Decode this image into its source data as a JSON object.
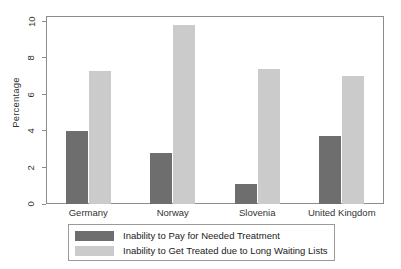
{
  "chart_data": {
    "type": "bar",
    "title": "",
    "subtitle": "",
    "xlabel": "",
    "ylabel": "Percentage",
    "categories": [
      "Germany",
      "Norway",
      "Slovenia",
      "United Kingdom"
    ],
    "series": [
      {
        "name": "Inability to Pay for Needed Treatment",
        "color": "#6e6e6e",
        "values": [
          4.0,
          2.8,
          1.1,
          3.7
        ]
      },
      {
        "name": "Inability to Get Treated due to Long Waiting Lists",
        "color": "#cbcbcb",
        "values": [
          7.3,
          9.8,
          7.4,
          7.0
        ]
      }
    ],
    "ylim": [
      0,
      10.3
    ],
    "yticks": [
      0,
      2,
      4,
      6,
      8,
      10
    ],
    "ytick_labels": [
      "0",
      "2",
      "4",
      "6",
      "8",
      "10"
    ],
    "grid": false,
    "legend_position": "bottom",
    "frame": true,
    "background_color": "#ffffff",
    "axis_color": "#8c8c8c"
  }
}
